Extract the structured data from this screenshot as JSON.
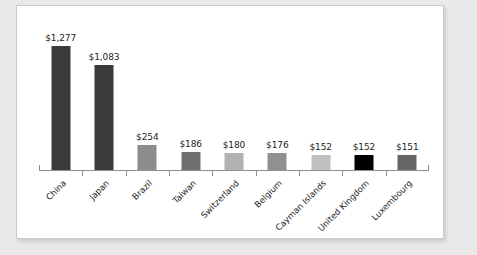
{
  "chart_data": {
    "type": "bar",
    "title": "",
    "subtitle": "",
    "xlabel": "",
    "ylabel": "",
    "ylim": [
      0,
      1400
    ],
    "grid": false,
    "legend": "none",
    "orientation": "vertical",
    "value_labels_shown": true,
    "value_label_format": "$#,###",
    "category_label_rotation": -45,
    "axis_ticks_between_categories": true,
    "categories": [
      "China",
      "Japan",
      "Brazil",
      "Taiwan",
      "Switzerland",
      "Belgium",
      "Cayman Islands",
      "United Kingdom",
      "Luxembourg"
    ],
    "values": [
      1277,
      1083,
      254,
      186,
      180,
      176,
      152,
      152,
      151
    ],
    "value_labels": [
      "$1,277",
      "$1,083",
      "$254",
      "$186",
      "$180",
      "$176",
      "$152",
      "$152",
      "$151"
    ],
    "bar_colors": [
      "#3b3b3b",
      "#3b3b3b",
      "#8c8c8c",
      "#707070",
      "#b2b2b2",
      "#909090",
      "#c0c0c0",
      "#000000",
      "#666666"
    ]
  },
  "style": {
    "page_background": "#e9e9e9",
    "panel_background": "#ffffff",
    "panel_border": "#c9c9c9",
    "axis_color": "#8f8f8f",
    "text_color": "#1d1d1d"
  }
}
